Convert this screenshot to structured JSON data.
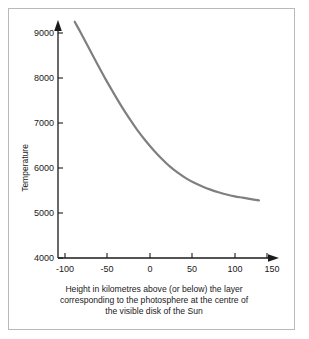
{
  "figure": {
    "background_color": "#ffffff",
    "frame_color": "#b9b9b9"
  },
  "chart_data": {
    "type": "line",
    "title": "",
    "subtitle": "",
    "xlabel": "Height in kilometres above (or below) the layer corresponding to the photosphere at the centre of the visible disk of the Sun",
    "ylabel": "Temperature",
    "xlim": [
      -100,
      150
    ],
    "ylim": [
      4000,
      9500
    ],
    "xticks": [
      -100,
      -50,
      0,
      50,
      100,
      150
    ],
    "xtick_labels": [
      "-100",
      "-50",
      "0",
      "50",
      "100",
      "150"
    ],
    "yticks": [
      4000,
      5000,
      6000,
      7000,
      8000,
      9000
    ],
    "ytick_labels": [
      "4000",
      "5000",
      "6000",
      "7000",
      "8000",
      "9000"
    ],
    "grid": false,
    "legend": null,
    "series": [
      {
        "name": "Temperature profile",
        "color": "#7f7f7f",
        "line_width": 2.2,
        "x": [
          -88,
          -80,
          -70,
          -60,
          -50,
          -40,
          -30,
          -20,
          -10,
          0,
          10,
          20,
          30,
          40,
          50,
          60,
          70,
          80,
          90,
          100,
          110,
          120,
          130,
          140
        ],
        "y": [
          9250,
          8990,
          8650,
          8310,
          7980,
          7670,
          7370,
          7090,
          6830,
          6600,
          6390,
          6200,
          6030,
          5890,
          5770,
          5670,
          5590,
          5520,
          5460,
          5410,
          5370,
          5340,
          5310,
          5280
        ]
      }
    ]
  },
  "caption": {
    "lines": [
      "Height in kilometres above (or below) the layer",
      "corresponding to the photosphere at the centre of",
      "the visible disk of the Sun"
    ]
  },
  "axes": {
    "x_axis_label": "Height in kilometres above (or below) the layer",
    "y_axis_label": "Temperature",
    "axis_color": "#1a1a1a"
  }
}
